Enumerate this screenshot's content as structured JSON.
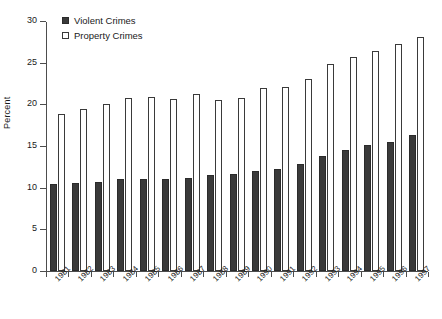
{
  "chart_data": {
    "type": "bar",
    "title": "",
    "subtitle": "",
    "xlabel": "",
    "ylabel": "Percent",
    "ylim": [
      0,
      30
    ],
    "ytick_step": 5,
    "yticks": [
      0,
      5,
      10,
      15,
      20,
      25,
      30
    ],
    "grid": false,
    "legend_position": "top-left",
    "categories": [
      "1981",
      "1982",
      "1983",
      "1984",
      "1985",
      "1986",
      "1987",
      "1988",
      "1989",
      "1990",
      "1991",
      "1992",
      "1993",
      "1994",
      "1995",
      "1996",
      "1997"
    ],
    "series": [
      {
        "name": "Violent Crimes",
        "color": "#3a3a3a",
        "style": "filled",
        "values": [
          10.5,
          10.6,
          10.7,
          11.1,
          11.1,
          11.0,
          11.2,
          11.5,
          11.7,
          12.0,
          12.2,
          12.9,
          13.8,
          14.5,
          15.1,
          15.5,
          16.3
        ]
      },
      {
        "name": "Property Crimes",
        "color": "#ffffff",
        "style": "open",
        "values": [
          18.8,
          19.4,
          20.0,
          20.8,
          20.9,
          20.7,
          21.2,
          20.5,
          20.8,
          22.0,
          22.1,
          23.1,
          24.8,
          25.7,
          26.4,
          27.2,
          28.1
        ]
      }
    ]
  },
  "legend": {
    "items": [
      {
        "label": "Violent Crimes",
        "style": "filled"
      },
      {
        "label": "Property Crimes",
        "style": "open"
      }
    ]
  }
}
